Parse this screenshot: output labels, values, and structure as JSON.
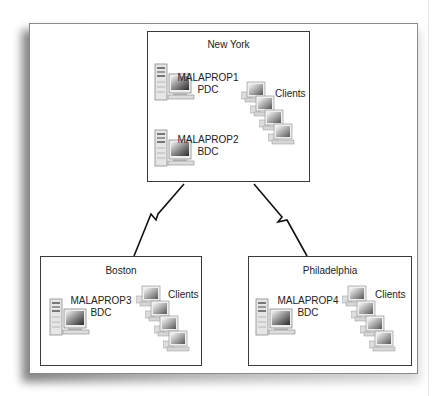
{
  "diagram": {
    "sites": [
      {
        "name": "New York",
        "servers": [
          {
            "name": "MALAPROP1",
            "role": "PDC"
          },
          {
            "name": "MALAPROP2",
            "role": "BDC"
          }
        ],
        "clients_label": "Clients"
      },
      {
        "name": "Boston",
        "servers": [
          {
            "name": "MALAPROP3",
            "role": "BDC"
          }
        ],
        "clients_label": "Clients"
      },
      {
        "name": "Philadelphia",
        "servers": [
          {
            "name": "MALAPROP4",
            "role": "BDC"
          }
        ],
        "clients_label": "Clients"
      }
    ],
    "links": [
      {
        "from": "New York",
        "to": "Boston",
        "type": "WAN-lightning"
      },
      {
        "from": "New York",
        "to": "Philadelphia",
        "type": "WAN-lightning"
      }
    ]
  },
  "colors": {
    "border": "#3a3a3a",
    "frame": "#8a8a8a",
    "text": "#222222"
  }
}
